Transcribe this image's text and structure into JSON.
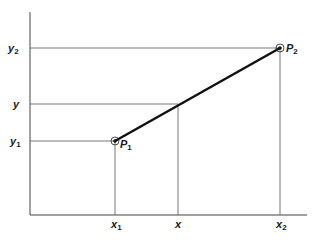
{
  "diagram": {
    "axes": {
      "y_labels": [
        {
          "id": "y2",
          "text": "y",
          "sub": "2"
        },
        {
          "id": "y",
          "text": "y",
          "sub": ""
        },
        {
          "id": "y1",
          "text": "y",
          "sub": "1"
        }
      ],
      "x_labels": [
        {
          "id": "x1",
          "text": "x",
          "sub": "1"
        },
        {
          "id": "x",
          "text": "x",
          "sub": ""
        },
        {
          "id": "x2",
          "text": "x",
          "sub": "2"
        }
      ]
    },
    "points": [
      {
        "id": "P1",
        "text": "P",
        "sub": "1"
      },
      {
        "id": "P2",
        "text": "P",
        "sub": "2"
      }
    ],
    "colors": {
      "line": "#111111",
      "guide": "#555555",
      "axis": "#444444"
    }
  }
}
